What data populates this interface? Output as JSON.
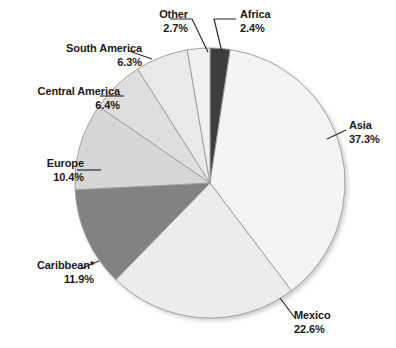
{
  "chart_data": {
    "type": "pie",
    "title": "",
    "subtitle": "",
    "xlabel": "",
    "ylabel": "",
    "units": "percent",
    "legend_position": "none",
    "labels_position": "callout-outside",
    "grid": false,
    "start_angle_deg": 0,
    "direction": "clockwise",
    "categories": [
      "Africa",
      "Asia",
      "Mexico",
      "Caribbean*",
      "Europe",
      "Central America",
      "South America",
      "Other"
    ],
    "values": [
      2.4,
      37.3,
      22.6,
      11.9,
      10.4,
      6.4,
      6.3,
      2.7
    ],
    "value_labels": [
      "2.4%",
      "37.3%",
      "22.6%",
      "11.9%",
      "10.4%",
      "6.4%",
      "6.3%",
      "2.7%"
    ],
    "slice_colors": [
      "#3d3d3d",
      "#f4f4f4",
      "#ececec",
      "#828282",
      "#d6d6d6",
      "#dedede",
      "#e9e9e9",
      "#f0f0f0"
    ],
    "slices": [
      {
        "name": "Africa",
        "value": 2.4,
        "value_label": "2.4%",
        "color": "#3d3d3d"
      },
      {
        "name": "Asia",
        "value": 37.3,
        "value_label": "37.3%",
        "color": "#f4f4f4"
      },
      {
        "name": "Mexico",
        "value": 22.6,
        "value_label": "22.6%",
        "color": "#ececec"
      },
      {
        "name": "Caribbean*",
        "value": 11.9,
        "value_label": "11.9%",
        "color": "#828282"
      },
      {
        "name": "Europe",
        "value": 10.4,
        "value_label": "10.4%",
        "color": "#d6d6d6"
      },
      {
        "name": "Central America",
        "value": 6.4,
        "value_label": "6.4%",
        "color": "#dedede"
      },
      {
        "name": "South America",
        "value": 6.3,
        "value_label": "6.3%",
        "color": "#e9e9e9"
      },
      {
        "name": "Other",
        "value": 2.7,
        "value_label": "2.7%",
        "color": "#f0f0f0"
      }
    ]
  },
  "labels": {
    "other": {
      "name": "Other",
      "pct": "2.7%"
    },
    "africa": {
      "name": "Africa",
      "pct": "2.4%"
    },
    "south_america": {
      "name": "South America",
      "pct": "6.3%"
    },
    "central_america": {
      "name": "Central America",
      "pct": "6.4%"
    },
    "europe": {
      "name": "Europe",
      "pct": "10.4%"
    },
    "caribbean": {
      "name": "Caribbean*",
      "pct": "11.9%"
    },
    "asia": {
      "name": "Asia",
      "pct": "37.3%"
    },
    "mexico": {
      "name": "Mexico",
      "pct": "22.6%"
    }
  },
  "style": {
    "background": "#ffffff",
    "text_color": "#1a1a1a",
    "leader_line_color": "#2b2b2b",
    "slice_border_color": "#9a9a9a",
    "shadow_color": "#c9c9c9"
  }
}
